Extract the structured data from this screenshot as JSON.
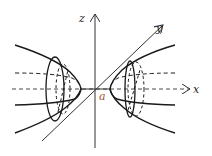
{
  "diagram": {
    "type": "hyperboloid-of-two-sheets",
    "labels": {
      "z_axis": "z",
      "y_axis": "y",
      "x_axis": "x",
      "vertex": "a"
    },
    "colors": {
      "stroke": "#1a1a1a",
      "axis": "#333333",
      "vertex_label": "#a0522d",
      "background": "#ffffff"
    }
  }
}
